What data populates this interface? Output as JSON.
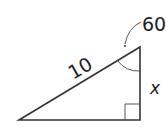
{
  "diagram": {
    "type": "right-triangle",
    "hypotenuse_label": "10",
    "angle_label": "60",
    "side_label": "x",
    "colors": {
      "stroke": "#333333",
      "text": "#222222",
      "background": "#ffffff"
    }
  }
}
